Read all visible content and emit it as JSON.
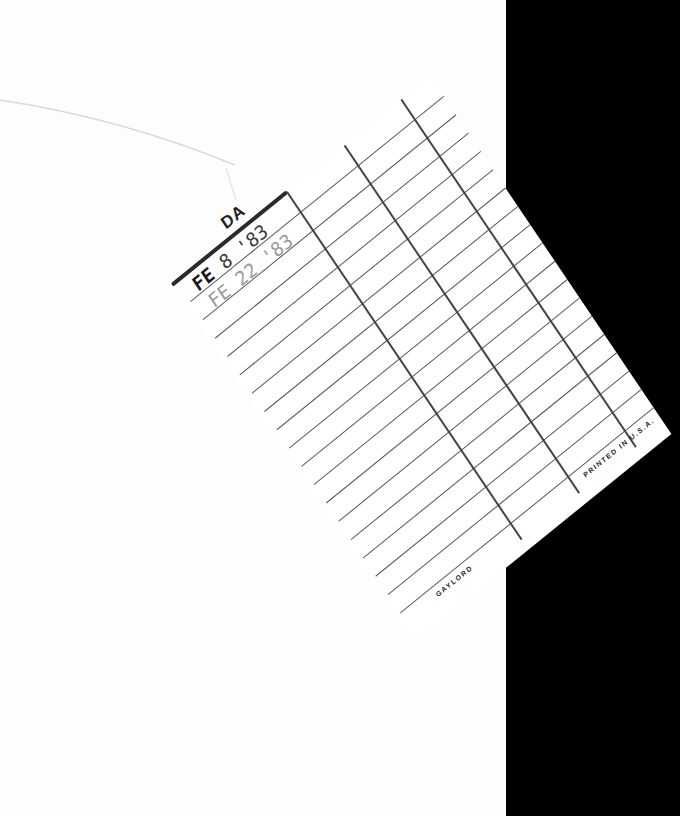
{
  "scene": {
    "description": "Library book pocket with a tilted date-due card on a black backdrop",
    "colors": {
      "page": "#fdfdfd",
      "backdrop": "#000000",
      "card": "#ffffff",
      "rule": "#555555",
      "header_rule": "#2a2a2a"
    }
  },
  "card": {
    "header_label": "DA",
    "header_label_full_hint": "DATE DUE",
    "stamps": [
      {
        "month": "FE",
        "date": "8 '83"
      },
      {
        "month": "FE",
        "date": "22 '83"
      }
    ],
    "row_count": 18,
    "column_dividers": 3,
    "footer_left": "GAYLORD",
    "footer_right": "PRINTED IN U.S.A."
  }
}
